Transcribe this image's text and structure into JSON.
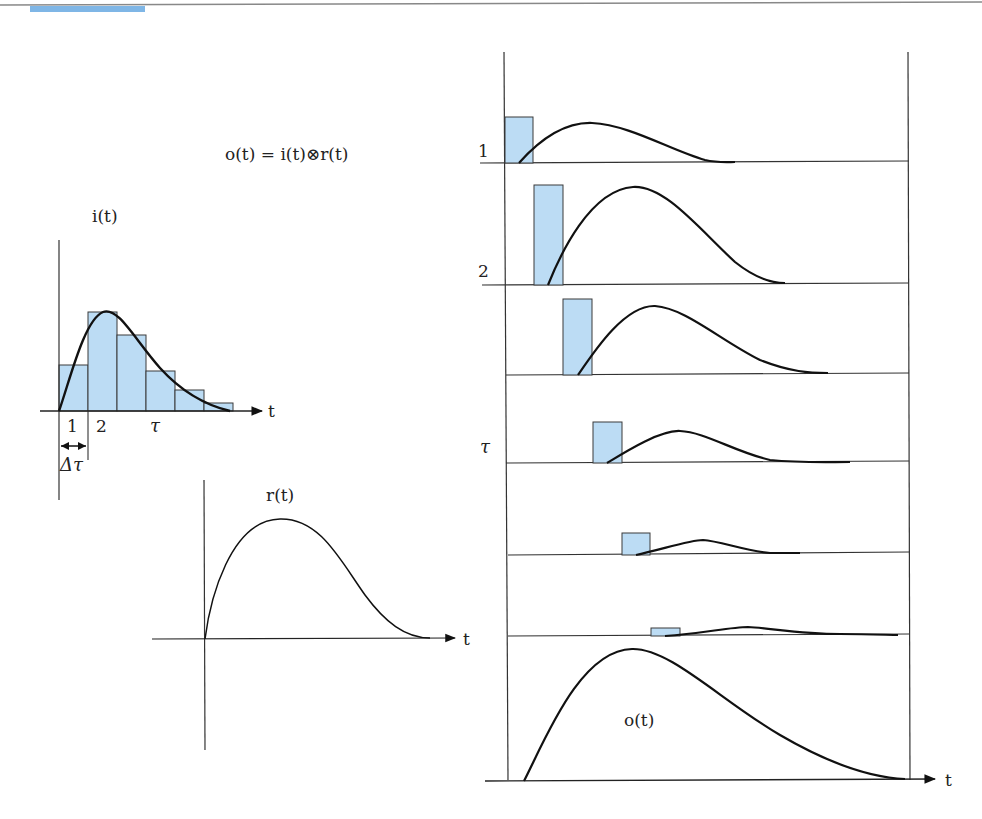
{
  "header": {
    "rule_color": "#777777",
    "accent_color": "#7fb6e6"
  },
  "equation": "o(t) = i(t)⊗r(t)",
  "input_panel": {
    "label": "i(t)",
    "axis_label": "t",
    "tick_1": "1",
    "tick_2": "2",
    "tick_tau": "τ",
    "delta_label": "Δτ",
    "bar_heights_rel": [
      0.47,
      1.0,
      0.78,
      0.4,
      0.21,
      0.08
    ]
  },
  "response_panel": {
    "label": "r(t)",
    "axis_label": "t"
  },
  "stack_panel": {
    "row_labels": [
      "1",
      "2",
      "τ"
    ],
    "output_label": "o(t)",
    "axis_label": "t"
  },
  "colors": {
    "bar_fill": "#bcdcf4",
    "bar_stroke": "#3a3a3a",
    "curve": "#111111",
    "axis": "#333333"
  }
}
